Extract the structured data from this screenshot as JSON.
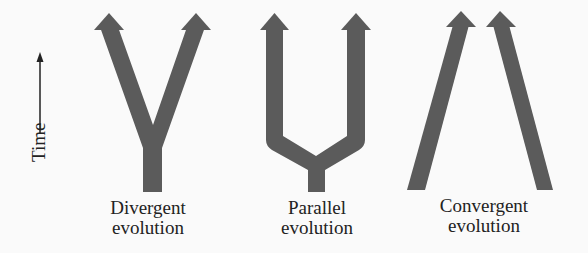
{
  "figure": {
    "axis": {
      "label": "Time",
      "direction": "up"
    },
    "panels": [
      {
        "id": "divergent",
        "line1": "Divergent",
        "line2": "evolution"
      },
      {
        "id": "parallel",
        "line1": "Parallel",
        "line2": "evolution"
      },
      {
        "id": "convergent",
        "line1": "Convergent",
        "line2": "evolution"
      }
    ],
    "colors": {
      "arrow_fill": "#5b5b5b",
      "background": "#fafafa",
      "text": "#222222"
    }
  }
}
